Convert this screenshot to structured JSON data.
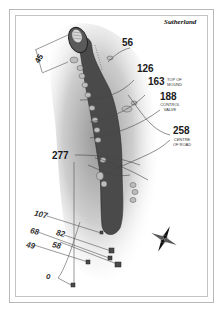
{
  "course": {
    "name": "Sutherland"
  },
  "hole_map": {
    "green_depth": "45",
    "yardages_right": [
      {
        "value": "56",
        "note": ""
      },
      {
        "value": "126",
        "note": ""
      },
      {
        "value": "163",
        "note": "TOP OF MOUND"
      },
      {
        "value": "188",
        "note": "CONTROL VALVE"
      },
      {
        "value": "258",
        "note": "CENTRE OF ROAD"
      }
    ],
    "yardages_left": [
      {
        "value": "277"
      }
    ],
    "tee_yardages": [
      "107",
      "82",
      "68",
      "58",
      "49",
      "0"
    ],
    "compass": {
      "icon": "compass-rose-icon"
    },
    "colors": {
      "fairway": "#4a4a4a",
      "rough_shade": "#9a9a9a",
      "green": "#5a5a5a",
      "frame": "#b8b8b8"
    }
  }
}
